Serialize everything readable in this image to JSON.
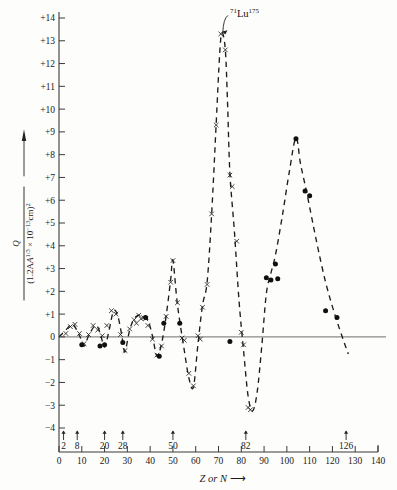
{
  "chart_data": {
    "type": "scatter",
    "title": "",
    "xlabel": "Z or N",
    "ylabel": "Q / (1.2A^(1/3) x 10^-13 cm)^2",
    "ylabel_numerator": "Q",
    "ylabel_denominator": "(1.2A",
    "ylabel_denom_exp": "1/3",
    "ylabel_denom_mid": " × 10",
    "ylabel_denom_exp2": "−13",
    "ylabel_denom_tail": "cm)",
    "ylabel_denom_sq": "2",
    "xlim": [
      0,
      140
    ],
    "ylim": [
      -4,
      14
    ],
    "grid": false,
    "legend_position": "none",
    "xticks": [
      0,
      10,
      20,
      30,
      40,
      50,
      60,
      70,
      80,
      90,
      100,
      110,
      120,
      130,
      140
    ],
    "xtick_labels": [
      "0",
      "10",
      "20",
      "30",
      "40",
      "50",
      "60",
      "70",
      "80",
      "90",
      "100",
      "110",
      "120",
      "130",
      "140"
    ],
    "yticks": [
      -4,
      -3,
      -2,
      -1,
      0,
      1,
      2,
      3,
      4,
      5,
      6,
      7,
      8,
      9,
      10,
      11,
      12,
      13,
      14
    ],
    "ytick_labels": [
      "−4",
      "−3",
      "−2",
      "−1",
      "0",
      "+1",
      "+2",
      "+3",
      "+4",
      "+5",
      "+6",
      "+7",
      "+8",
      "+9",
      "+10",
      "+11",
      "+12",
      "+13",
      "+14"
    ],
    "magic_numbers": [
      2,
      8,
      20,
      28,
      50,
      82,
      126
    ],
    "magic_number_labels": [
      "2",
      "8",
      "20",
      "28",
      "50",
      "82",
      "126"
    ],
    "annotations": [
      {
        "text_pre": "71",
        "text_main": "Lu",
        "text_post": "175",
        "label": "71Lu175",
        "x": 71,
        "y": 13.3,
        "label_x": 75,
        "label_y": 14.2
      }
    ],
    "series": [
      {
        "name": "cross-markers",
        "marker": "x",
        "points": [
          [
            3,
            0.15
          ],
          [
            5,
            0.45
          ],
          [
            7,
            0.55
          ],
          [
            9,
            0.15
          ],
          [
            11,
            -0.3
          ],
          [
            13,
            0.1
          ],
          [
            15,
            0.5
          ],
          [
            17,
            0.3
          ],
          [
            19,
            0.05
          ],
          [
            21,
            0.5
          ],
          [
            23,
            1.15
          ],
          [
            25,
            1.0
          ],
          [
            27,
            0.1
          ],
          [
            29,
            -0.6
          ],
          [
            31,
            0.35
          ],
          [
            33,
            0.75
          ],
          [
            34,
            0.6
          ],
          [
            35,
            0.95
          ],
          [
            36,
            0.8
          ],
          [
            37,
            0.85
          ],
          [
            38,
            0.8
          ],
          [
            39,
            0.5
          ],
          [
            41,
            -0.1
          ],
          [
            43,
            -0.8
          ],
          [
            45,
            -0.4
          ],
          [
            47,
            0.9
          ],
          [
            49,
            2.4
          ],
          [
            50,
            3.35
          ],
          [
            52,
            1.5
          ],
          [
            54,
            -0.05
          ],
          [
            55,
            -0.15
          ],
          [
            57,
            -1.6
          ],
          [
            59,
            -2.15
          ],
          [
            61,
            0.05
          ],
          [
            62,
            -0.1
          ],
          [
            63,
            1.3
          ],
          [
            65,
            2.3
          ],
          [
            67,
            5.4
          ],
          [
            69,
            9.3
          ],
          [
            71,
            13.3
          ],
          [
            73,
            12.6
          ],
          [
            75,
            7.1
          ],
          [
            76,
            6.6
          ],
          [
            78,
            4.2
          ],
          [
            80,
            0.2
          ],
          [
            81,
            -0.35
          ],
          [
            83,
            -3.1
          ],
          [
            84,
            -3.2
          ]
        ]
      },
      {
        "name": "dot-markers",
        "marker": "o",
        "points": [
          [
            10,
            -0.35
          ],
          [
            18,
            -0.4
          ],
          [
            20,
            -0.35
          ],
          [
            28,
            -0.25
          ],
          [
            38,
            0.85
          ],
          [
            44,
            -0.85
          ],
          [
            46,
            0.6
          ],
          [
            53,
            0.6
          ],
          [
            75,
            -0.2
          ],
          [
            91,
            2.6
          ],
          [
            93,
            2.5
          ],
          [
            95,
            3.2
          ],
          [
            96,
            2.55
          ],
          [
            104,
            8.7
          ],
          [
            108,
            6.4
          ],
          [
            110,
            6.2
          ],
          [
            117,
            1.15
          ],
          [
            122,
            0.85
          ]
        ]
      }
    ],
    "curve": {
      "name": "interpolating-dashed-curve",
      "style": "dashed",
      "points": [
        [
          0,
          0
        ],
        [
          3,
          0.3
        ],
        [
          6,
          0.55
        ],
        [
          9,
          0.05
        ],
        [
          11,
          -0.4
        ],
        [
          13,
          0.05
        ],
        [
          16,
          0.5
        ],
        [
          18,
          0.2
        ],
        [
          20,
          -0.45
        ],
        [
          22,
          0.3
        ],
        [
          24,
          1.15
        ],
        [
          26,
          0.85
        ],
        [
          28,
          -0.2
        ],
        [
          29,
          -0.65
        ],
        [
          31,
          0.3
        ],
        [
          33,
          0.8
        ],
        [
          35,
          0.95
        ],
        [
          37,
          0.9
        ],
        [
          39,
          0.75
        ],
        [
          41,
          0.05
        ],
        [
          43,
          -0.85
        ],
        [
          45,
          -0.3
        ],
        [
          47,
          0.9
        ],
        [
          49,
          2.5
        ],
        [
          50,
          3.35
        ],
        [
          52,
          1.4
        ],
        [
          55,
          -0.6
        ],
        [
          57,
          -1.8
        ],
        [
          59,
          -2.2
        ],
        [
          61,
          -0.3
        ],
        [
          63,
          1.4
        ],
        [
          65,
          2.4
        ],
        [
          67,
          5.4
        ],
        [
          69,
          9.4
        ],
        [
          70.5,
          12.4
        ],
        [
          71.5,
          13.35
        ],
        [
          73,
          12.6
        ],
        [
          74,
          10.2
        ],
        [
          75,
          7.2
        ],
        [
          77,
          4.6
        ],
        [
          79,
          1.6
        ],
        [
          81,
          -0.6
        ],
        [
          83,
          -2.6
        ],
        [
          85,
          -3.25
        ],
        [
          87,
          -2.4
        ],
        [
          89,
          -0.4
        ],
        [
          91,
          1.9
        ],
        [
          93,
          2.8
        ],
        [
          95,
          3.6
        ],
        [
          98,
          5.3
        ],
        [
          101,
          7.2
        ],
        [
          104,
          8.75
        ],
        [
          106,
          7.6
        ],
        [
          109,
          6.2
        ],
        [
          113,
          4.2
        ],
        [
          117,
          2.4
        ],
        [
          121,
          1.0
        ],
        [
          125,
          -0.2
        ],
        [
          127,
          -0.75
        ]
      ]
    }
  },
  "figure": {
    "yaxis_arrow": "up-arrow",
    "xaxis_arrow": "right-arrow"
  }
}
